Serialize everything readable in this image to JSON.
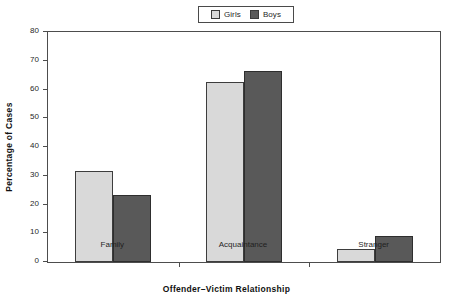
{
  "chart_data": {
    "type": "bar",
    "title": "",
    "xlabel": "Offender–Victim Relationship",
    "ylabel": "Percentage of Cases",
    "categories": [
      "Family",
      "Acquaintance",
      "Stranger"
    ],
    "series": [
      {
        "name": "Girls",
        "color": "#d9d9d9",
        "values": [
          31.8,
          62.5,
          4.5
        ]
      },
      {
        "name": "Boys",
        "color": "#595959",
        "values": [
          23.2,
          66.3,
          9.0
        ]
      }
    ],
    "ylim": [
      0,
      80
    ],
    "yticks": [
      0,
      10,
      20,
      30,
      40,
      50,
      60,
      70,
      80
    ],
    "ytick_labels": [
      "0",
      "10",
      "20",
      "30",
      "40",
      "50",
      "60",
      "70",
      "80"
    ],
    "grid": false,
    "legend_position": "top-center",
    "frame": "box"
  },
  "legend": {
    "items": [
      {
        "label": "Girls",
        "swatch": "legend-swatch-girls"
      },
      {
        "label": "Boys",
        "swatch": "legend-swatch-boys"
      }
    ]
  },
  "axes": {
    "y_title": "Percentage of Cases",
    "x_title": "Offender–Victim Relationship"
  }
}
